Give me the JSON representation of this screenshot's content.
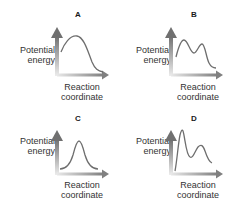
{
  "figure": {
    "colors": {
      "curve": "#6e6e6e",
      "axis_arrow_dark": "#7a7a7a",
      "axis_arrow_light": "#e6e6e6",
      "text": "#333333",
      "panel_letter": "#1a1a1a"
    },
    "panels": [
      {
        "letter": "A",
        "y_label_line1": "Potential",
        "y_label_line2": "energy",
        "x_label_line1": "Reaction",
        "x_label_line2": "coordinate",
        "curve_description": "single peak, skewed left, ends lower than start"
      },
      {
        "letter": "B",
        "y_label_line1": "Potential",
        "y_label_line2": "energy",
        "x_label_line1": "Reaction",
        "x_label_line2": "coordinate",
        "curve_description": "two peaks of similar height, ends lower than start"
      },
      {
        "letter": "C",
        "y_label_line1": "Potential",
        "y_label_line2": "energy",
        "x_label_line1": "Reaction",
        "x_label_line2": "coordinate",
        "curve_description": "single symmetric peak, starts and ends at same level"
      },
      {
        "letter": "D",
        "y_label_line1": "Potential",
        "y_label_line2": "energy",
        "x_label_line1": "Reaction",
        "x_label_line2": "coordinate",
        "curve_description": "tall first peak, lower second peak, ends slightly lower than start"
      }
    ]
  }
}
